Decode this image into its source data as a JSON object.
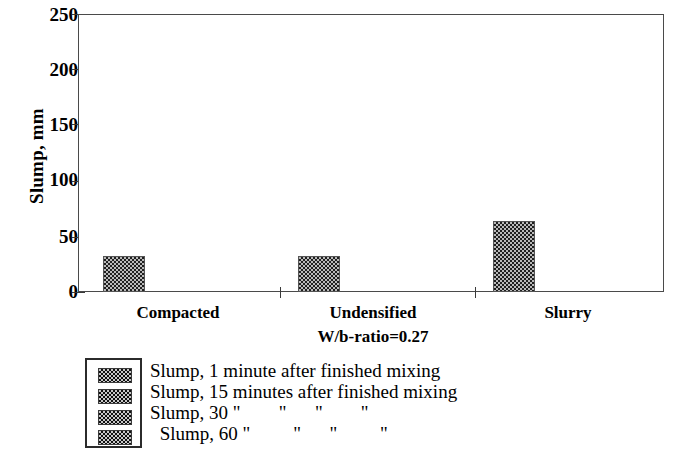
{
  "chart_data": {
    "type": "bar",
    "title": "",
    "subtitle": "",
    "xlabel": "W/b-ratio=0.27",
    "ylabel": "Slump, mm",
    "categories": [
      "Compacted",
      "Undensified",
      "Slurry"
    ],
    "ylim": [
      0,
      250
    ],
    "ytick_labels": [
      "250",
      "200",
      "150",
      "100",
      "50",
      "0"
    ],
    "ytick_values": [
      250,
      200,
      150,
      100,
      50,
      0
    ],
    "grid": false,
    "legend_position": "below-left",
    "series": [
      {
        "name": "Slump, 1 minute after finished mixing",
        "values": [
          32,
          32,
          64
        ]
      },
      {
        "name": "Slump, 15 minutes after finished mixing",
        "values": [
          null,
          null,
          null
        ]
      },
      {
        "name": "Slump, 30 \"        \"      \"        \"",
        "values": [
          null,
          null,
          null
        ]
      },
      {
        "name": " Slump, 60 \"         \"      \"         \"",
        "values": [
          null,
          null,
          null
        ]
      }
    ],
    "legend_entries": [
      "Slump, 1 minute after finished mixing",
      "Slump, 15 minutes after finished mixing",
      "Slump, 30 \"        \"      \"        \"",
      " Slump, 60 \"         \"      \"         \""
    ],
    "bar_fill_pattern": "checkerboard-dotted",
    "colors": {
      "axis": "#3a3a3a",
      "frame": "#4a4a4a",
      "bar_fill": "#b9b9b9",
      "bar_pattern": "#1f1f1f",
      "background": "#ffffff",
      "text": "#000000"
    }
  },
  "axis": {
    "y_title": "Slump, mm",
    "ticks": [
      {
        "label": "250",
        "value": 250
      },
      {
        "label": "200",
        "value": 200
      },
      {
        "label": "150",
        "value": 150
      },
      {
        "label": "100",
        "value": 100
      },
      {
        "label": "50",
        "value": 50
      },
      {
        "label": "0",
        "value": 0
      }
    ]
  },
  "categories": [
    {
      "label": "Compacted"
    },
    {
      "label": "Undensified"
    },
    {
      "label": "Slurry"
    }
  ],
  "x_sublabel": "W/b-ratio=0.27",
  "legend": {
    "rows": [
      {
        "label": "Slump, 1 minute after finished mixing"
      },
      {
        "label": "Slump, 15 minutes after finished mixing"
      },
      {
        "label": "Slump, 30 \"        \"      \"        \""
      },
      {
        "label": " Slump, 60 \"         \"      \"         \""
      }
    ]
  },
  "bars": [
    {
      "category": "Compacted",
      "value": 32
    },
    {
      "category": "Undensified",
      "value": 32
    },
    {
      "category": "Slurry",
      "value": 64
    }
  ]
}
